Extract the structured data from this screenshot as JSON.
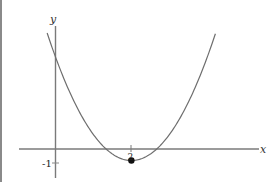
{
  "chart_data": {
    "type": "line",
    "title": "",
    "xlabel": "x",
    "ylabel": "y",
    "function": "y = (x - 1)(x - 3) = x^2 - 4x + 3",
    "series": [
      {
        "name": "parabola",
        "x": [
          -1.3,
          -1,
          0,
          1,
          2,
          3,
          4,
          5,
          5.3
        ],
        "values": [
          8.49,
          8,
          3,
          0,
          -1,
          0,
          3,
          8,
          9.69
        ]
      }
    ],
    "points": [
      {
        "label": "vertex",
        "x": 2,
        "y": -1
      }
    ],
    "x_tick_labels": [
      "-1",
      "2"
    ],
    "x_ticks": [
      -1,
      2
    ],
    "xlim": [
      -2.4,
      6.2
    ],
    "ylim": [
      -2.6,
      12.5
    ],
    "grid": false,
    "legend": "none",
    "y_axis_position_x": -1
  },
  "labels": {
    "x_axis": "x",
    "y_axis": "y",
    "tick_neg1": "-1",
    "tick_2": "2"
  },
  "colors": {
    "curve": "#6e6e6e",
    "axes": "#7a7a7a",
    "point": "#111111",
    "border": "#8a8a8a"
  }
}
